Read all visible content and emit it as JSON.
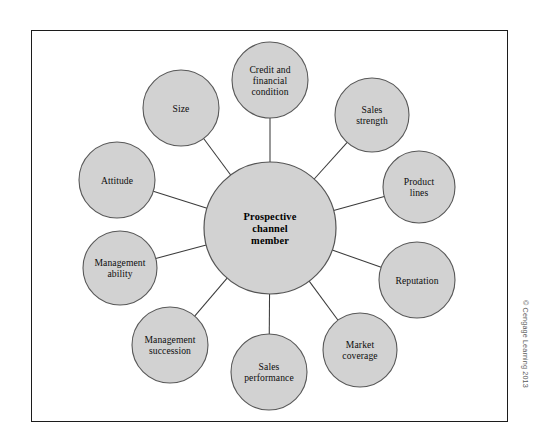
{
  "figure": {
    "type": "radial-hub-and-spoke",
    "background_color": "#ffffff",
    "frame_color": "#1c1c1c",
    "node_fill": "#d2d2d2",
    "node_stroke": "#585858",
    "spoke_color": "#3b3b3b",
    "label_color": "#0d0d0d"
  },
  "hub": {
    "name": "prospective-channel-member",
    "lines": [
      "Prospective",
      "channel",
      "member"
    ],
    "cx": 270,
    "cy": 228,
    "r": 66
  },
  "satellites": [
    {
      "name": "credit-and-financial-condition",
      "lines": [
        "Credit and",
        "financial",
        "condition"
      ],
      "cx": 270,
      "cy": 80,
      "r": 38
    },
    {
      "name": "sales-strength",
      "lines": [
        "Sales",
        "strength"
      ],
      "cx": 372,
      "cy": 115,
      "r": 37
    },
    {
      "name": "product-lines",
      "lines": [
        "Product",
        "lines"
      ],
      "cx": 419,
      "cy": 187,
      "r": 36
    },
    {
      "name": "reputation",
      "lines": [
        "Reputation"
      ],
      "cx": 417,
      "cy": 280,
      "r": 38
    },
    {
      "name": "market-coverage",
      "lines": [
        "Market",
        "coverage"
      ],
      "cx": 360,
      "cy": 350,
      "r": 37
    },
    {
      "name": "sales-performance",
      "lines": [
        "Sales",
        "performance"
      ],
      "cx": 269,
      "cy": 372,
      "r": 38
    },
    {
      "name": "management-succession",
      "lines": [
        "Management",
        "succession"
      ],
      "cx": 170,
      "cy": 345,
      "r": 38
    },
    {
      "name": "management-ability",
      "lines": [
        "Management",
        "ability"
      ],
      "cx": 120,
      "cy": 268,
      "r": 37
    },
    {
      "name": "attitude",
      "lines": [
        "Attitude"
      ],
      "cx": 117,
      "cy": 180,
      "r": 38
    },
    {
      "name": "size",
      "lines": [
        "Size"
      ],
      "cx": 181,
      "cy": 108,
      "r": 38
    }
  ],
  "credit": {
    "text": "© Cengage Learning 2013"
  }
}
